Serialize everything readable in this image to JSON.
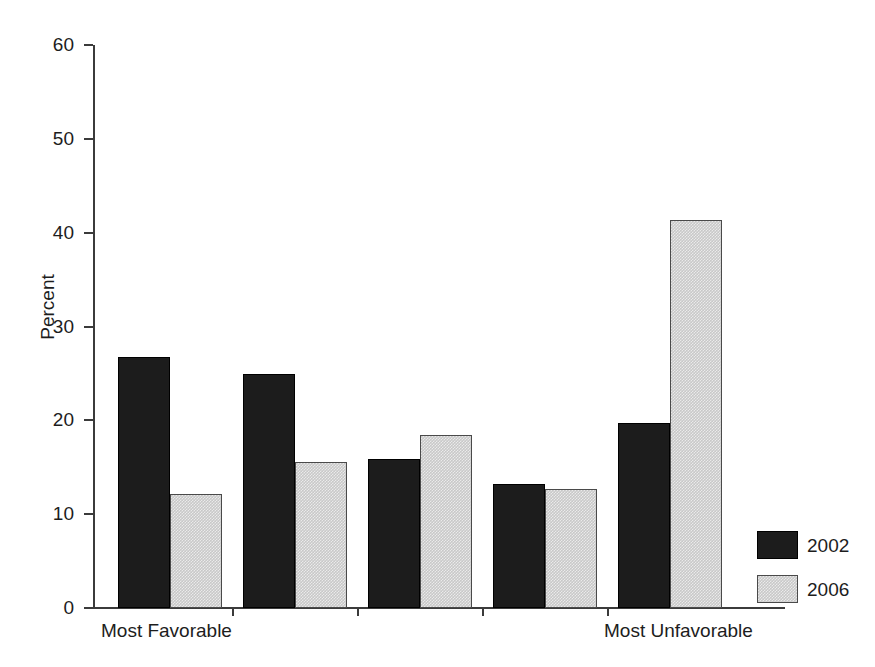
{
  "chart_data": {
    "type": "bar",
    "title": "",
    "xlabel": "",
    "ylabel": "Percent",
    "ylim": [
      0,
      60
    ],
    "yticks": [
      0,
      10,
      20,
      30,
      40,
      50,
      60
    ],
    "grid": false,
    "legend_position": "right-bottom-outside",
    "categories": [
      "Most Favorable",
      "",
      "",
      "",
      "Most Unfavorable"
    ],
    "axis_end_labels": {
      "left": "Most Favorable",
      "right": "Most Unfavorable"
    },
    "series": [
      {
        "name": "2002",
        "color": "#1c1c1c",
        "values": [
          26.7,
          24.9,
          15.9,
          13.2,
          19.7
        ]
      },
      {
        "name": "2006",
        "color": "#c8c8c8",
        "values": [
          12.1,
          15.6,
          18.4,
          12.7,
          41.3
        ]
      }
    ]
  },
  "legend": {
    "items": [
      {
        "label": "2002"
      },
      {
        "label": "2006"
      }
    ]
  }
}
